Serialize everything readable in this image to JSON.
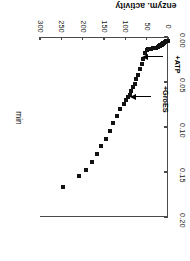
{
  "figure": {
    "rotation_deg": 180,
    "background": "#ffffff",
    "marker_color": "#121212",
    "axis_color": "#4a4a4a"
  },
  "chart_data": {
    "type": "scatter",
    "title": "",
    "xlabel": "min",
    "ylabel": "enzym. activity",
    "xlim": [
      0,
      300
    ],
    "ylim": [
      0.0,
      0.2
    ],
    "xticks": [
      0,
      50,
      100,
      150,
      200,
      250,
      300
    ],
    "xticklabels": [
      "0",
      "50",
      "100",
      "150",
      "200",
      "250",
      "300"
    ],
    "yticks": [
      0.0,
      0.05,
      0.1,
      0.15,
      0.2
    ],
    "yticklabels": [
      "0.00",
      "0.05",
      "0.10",
      "0.15",
      "0.20"
    ],
    "grid": false,
    "legend": null,
    "series": [
      {
        "name": "enzym. activity",
        "marker": "square",
        "x": [
          1,
          2,
          3,
          4,
          5,
          6,
          7,
          8,
          9,
          10,
          11,
          12,
          13,
          14,
          15,
          16,
          17,
          18,
          19,
          20,
          21,
          22,
          24,
          27,
          31,
          36,
          41,
          46,
          50,
          54,
          58,
          62,
          66,
          70,
          74,
          78,
          82,
          86,
          90,
          94,
          98,
          104,
          112,
          120,
          128,
          137,
          146,
          156,
          166,
          178,
          192,
          208,
          245
        ],
        "y": [
          0.004,
          0.004,
          0.005,
          0.005,
          0.005,
          0.006,
          0.006,
          0.006,
          0.007,
          0.007,
          0.007,
          0.008,
          0.008,
          0.008,
          0.009,
          0.009,
          0.009,
          0.009,
          0.01,
          0.01,
          0.01,
          0.01,
          0.011,
          0.012,
          0.012,
          0.012,
          0.013,
          0.013,
          0.014,
          0.018,
          0.024,
          0.03,
          0.036,
          0.042,
          0.047,
          0.052,
          0.056,
          0.06,
          0.064,
          0.067,
          0.07,
          0.074,
          0.08,
          0.088,
          0.096,
          0.105,
          0.113,
          0.121,
          0.13,
          0.139,
          0.148,
          0.155,
          0.167
        ]
      }
    ],
    "annotations": [
      {
        "label": "+ATP",
        "x_arrow": 60,
        "y_arrow": 0.022,
        "note": "arrow points to start of first activity rise"
      },
      {
        "label": "+GroES",
        "x_arrow": 90,
        "y_arrow": 0.066,
        "note": "arrow points to second inflection of the curve"
      }
    ]
  }
}
